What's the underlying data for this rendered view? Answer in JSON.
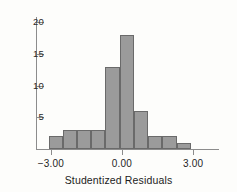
{
  "chart_data": {
    "type": "bar",
    "title": "",
    "subtitle": "",
    "xlabel": "Studentized Residuals",
    "ylabel": "",
    "grid": false,
    "legend": null,
    "xlim": [
      -3.6,
      3.6
    ],
    "ylim": [
      0,
      21
    ],
    "x_tick_labels": [
      "-3.00",
      "0.00",
      "3.00"
    ],
    "x_tick_values": [
      -3.0,
      0.0,
      3.0
    ],
    "y_tick_labels": [
      "5",
      "10",
      "15",
      "20"
    ],
    "y_tick_values": [
      5,
      10,
      15,
      20
    ],
    "bin_edges": [
      -3.1,
      -2.5,
      -1.9,
      -1.3,
      -0.7,
      -0.1,
      0.5,
      1.1,
      1.7,
      2.3,
      2.9
    ],
    "categories": [
      "-3.10 to -2.50",
      "-2.50 to -1.90",
      "-1.90 to -1.30",
      "-1.30 to -0.70",
      "-0.70 to -0.10",
      "-0.10 to 0.50",
      "0.50 to 1.10",
      "1.10 to 1.70",
      "1.70 to 2.30",
      "2.30 to 2.90"
    ],
    "values": [
      2,
      3,
      3,
      3,
      13,
      18,
      6,
      2,
      2,
      1
    ],
    "bar_color": "#9b9b9b",
    "bar_border_color": "#6a6a6a",
    "axis_color": "#8c8c8c",
    "background_color": "#fdfdfb"
  }
}
